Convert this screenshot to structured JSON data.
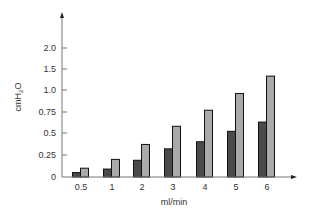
{
  "chart_data": {
    "type": "bar",
    "title": "",
    "xlabel": "ml/min",
    "ylabel": "cmH2O",
    "ylabel_parts": {
      "base": "cmH",
      "sub": "2",
      "tail": "O"
    },
    "categories": [
      "0.5",
      "1",
      "2",
      "3",
      "4",
      "5",
      "6"
    ],
    "series": [
      {
        "name": "Series A (dark)",
        "color": "#4a4a4a",
        "values": [
          0.05,
          0.09,
          0.19,
          0.32,
          0.4,
          0.52,
          0.63
        ]
      },
      {
        "name": "Series B (light)",
        "color": "#aaaaaa",
        "values": [
          0.1,
          0.2,
          0.37,
          0.58,
          0.77,
          0.96,
          1.33
        ]
      }
    ],
    "y_ticks": [
      0,
      0.25,
      0.5,
      0.75,
      1.0,
      1.5,
      2.0
    ],
    "y_tick_labels": [
      "0",
      "0.25",
      "0.5",
      "0.75",
      "1.0",
      "1.5",
      "2.0"
    ],
    "ylim": [
      0,
      2.0
    ],
    "grid": false,
    "legend": "none"
  }
}
